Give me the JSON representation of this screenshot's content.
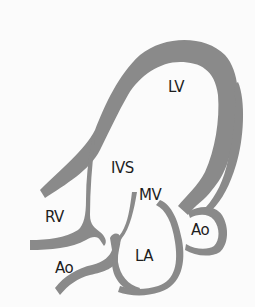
{
  "diagram": {
    "type": "cardiac-anatomy",
    "wall_color": "#8a8a8a",
    "background_color": "#fbfbfb",
    "text_color": "#1e1e1e",
    "labels": {
      "lv": "LV",
      "ivs": "IVS",
      "mv": "MV",
      "rv": "RV",
      "la": "LA",
      "ao_left": "Ao",
      "ao_right": "Ao"
    }
  }
}
